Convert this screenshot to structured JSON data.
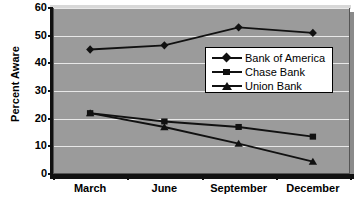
{
  "chart_data": {
    "type": "line",
    "title": "",
    "xlabel": "",
    "ylabel": "Percent Aware",
    "categories": [
      "March",
      "June",
      "September",
      "December"
    ],
    "ylim": [
      0,
      60
    ],
    "yticks": [
      0,
      10,
      20,
      30,
      40,
      50,
      60
    ],
    "grid": true,
    "legend_position": "inside-right",
    "series": [
      {
        "name": "Bank of America",
        "marker": "diamond",
        "values": [
          45,
          46.5,
          53,
          51
        ]
      },
      {
        "name": "Chase Bank",
        "marker": "square",
        "values": [
          22,
          19,
          17,
          13.5
        ]
      },
      {
        "name": "Union Bank",
        "marker": "triangle",
        "values": [
          22,
          17,
          11,
          4.5
        ]
      }
    ],
    "colors": {
      "plot_background": "#9b9b9b",
      "gridline": "#e8e8e8",
      "series_line": "#111111",
      "axis": "#111111",
      "legend_background": "#ffffff",
      "page_background": "#ffffff"
    }
  },
  "y_axis": {
    "title": "Percent Aware",
    "tick_labels": [
      "60",
      "50",
      "40",
      "30",
      "20",
      "10",
      "0"
    ]
  },
  "x_axis": {
    "tick_labels": [
      "March",
      "June",
      "September",
      "December"
    ]
  },
  "legend": {
    "entries": [
      {
        "label": "Bank of America"
      },
      {
        "label": "Chase Bank"
      },
      {
        "label": "Union Bank"
      }
    ]
  }
}
